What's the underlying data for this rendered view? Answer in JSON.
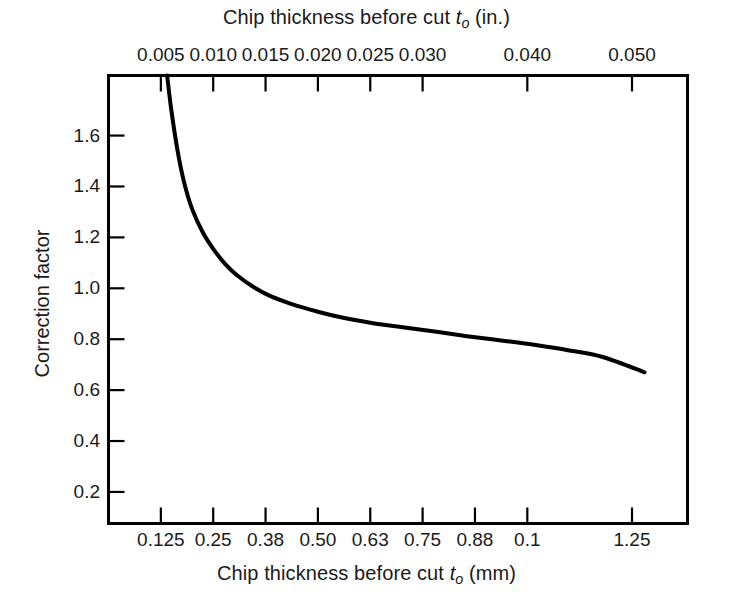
{
  "figure": {
    "top_axis_title_prefix": "Chip thickness before cut ",
    "top_axis_title_var": "t",
    "top_axis_title_sub": "o",
    "top_axis_title_suffix": " (in.)",
    "bottom_axis_title_prefix": "Chip thickness before cut ",
    "bottom_axis_title_var": "t",
    "bottom_axis_title_sub": "o",
    "bottom_axis_title_suffix": " (mm)",
    "y_axis_title": "Correction factor",
    "line_color": "#000000",
    "frame_color": "#000000",
    "background": "#ffffff"
  },
  "chart_data": {
    "type": "line",
    "title": "",
    "xlabel": "Chip thickness before cut to (mm)",
    "ylabel": "Correction factor",
    "xlabel_top": "Chip thickness before cut to (in.)",
    "grid": false,
    "legend": "none",
    "xlim": [
      0.105,
      1.3
    ],
    "ylim": [
      0.076,
      1.836
    ],
    "x_ticks_bottom": [
      0.125,
      0.25,
      0.38,
      0.5,
      0.63,
      0.75,
      0.88,
      1.0,
      1.25
    ],
    "x_tick_labels_bottom": [
      "0.125",
      "0.25",
      "0.38",
      "0.50",
      "0.63",
      "0.75",
      "0.88",
      "0.1",
      "1.25"
    ],
    "x_ticks_top": [
      0.005,
      0.01,
      0.015,
      0.02,
      0.025,
      0.03,
      0.04,
      0.05
    ],
    "x_tick_labels_top": [
      "0.005",
      "0.010",
      "0.015",
      "0.020",
      "0.025",
      "0.030",
      "0.040",
      "0.050"
    ],
    "y_ticks": [
      0.2,
      0.4,
      0.6,
      0.8,
      1.0,
      1.2,
      1.4,
      1.6
    ],
    "y_tick_labels": [
      "0.2",
      "0.4",
      "0.6",
      "0.8",
      "1.0",
      "1.2",
      "1.4",
      "1.6"
    ],
    "series": [
      {
        "name": "Correction factor",
        "x": [
          0.14,
          0.15,
          0.165,
          0.18,
          0.2,
          0.225,
          0.25,
          0.28,
          0.31,
          0.35,
          0.39,
          0.44,
          0.5,
          0.56,
          0.63,
          0.7,
          0.78,
          0.86,
          0.94,
          1.02,
          1.1,
          1.18,
          1.28
        ],
        "y": [
          1.836,
          1.7,
          1.54,
          1.42,
          1.31,
          1.22,
          1.155,
          1.095,
          1.05,
          1.005,
          0.97,
          0.938,
          0.908,
          0.885,
          0.865,
          0.848,
          0.83,
          0.812,
          0.795,
          0.777,
          0.756,
          0.73,
          0.67
        ]
      }
    ]
  }
}
